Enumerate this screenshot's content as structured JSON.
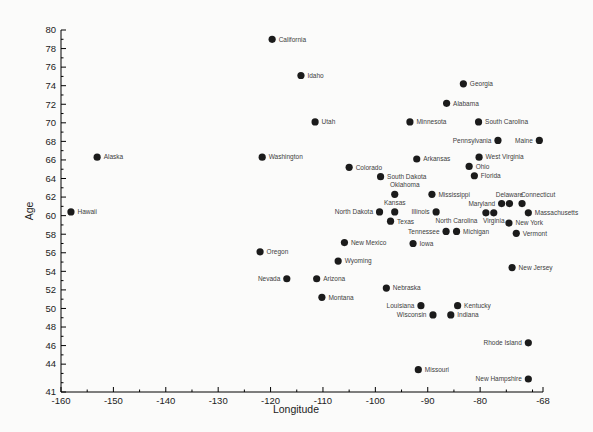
{
  "figure": {
    "background": "#fbfbfa",
    "axis_color": "#000000",
    "tick_label_color": "#222222",
    "point_label_color": "#3d3d3d"
  },
  "chart_data": {
    "type": "scatter",
    "title": "",
    "xlabel": "Longitude",
    "ylabel": "Age",
    "x_range": [
      -160,
      -68
    ],
    "y_range": [
      41,
      80
    ],
    "grid": false,
    "legend": "none",
    "point_color": "#1b1b1b",
    "point_radius": 3.6,
    "x_major_ticks": [
      -160,
      -150,
      -140,
      -130,
      -120,
      -110,
      -100,
      -90,
      -80,
      -68
    ],
    "x_major_tick_labels": [
      "-160",
      "-150",
      "-140",
      "-130",
      "-120",
      "-110",
      "-100",
      "-90",
      "-80",
      "-68"
    ],
    "x_minor_ticks": [
      -155,
      -145,
      -135,
      -125,
      -115,
      -105,
      -95,
      -85,
      -75,
      -70
    ],
    "y_major_ticks": [
      80,
      78,
      76,
      74,
      72,
      70,
      68,
      66,
      64,
      62,
      60,
      58,
      56,
      54,
      52,
      50,
      48,
      46,
      44,
      41
    ],
    "y_major_tick_labels": [
      "80",
      "78",
      "76",
      "74",
      "72",
      "70",
      "68",
      "66",
      "64",
      "62",
      "60",
      "58",
      "56",
      "54",
      "52",
      "50",
      "48",
      "46",
      "44",
      "41"
    ],
    "y_minor_ticks": [
      79,
      77,
      75,
      73,
      71,
      69,
      67,
      65,
      63,
      61,
      59,
      57,
      55,
      53,
      51,
      49,
      47,
      45,
      43,
      42
    ],
    "points": [
      {
        "label": "Hawaii",
        "x": -158.1,
        "y": 60.4,
        "side": "right"
      },
      {
        "label": "Alaska",
        "x": -153.1,
        "y": 66.3,
        "side": "right"
      },
      {
        "label": "Oregon",
        "x": -122.0,
        "y": 56.1,
        "side": "right"
      },
      {
        "label": "Washington",
        "x": -121.6,
        "y": 66.3,
        "side": "right"
      },
      {
        "label": "California",
        "x": -119.7,
        "y": 79.0,
        "side": "right"
      },
      {
        "label": "Nevada",
        "x": -116.9,
        "y": 53.2,
        "side": "left"
      },
      {
        "label": "Idaho",
        "x": -114.2,
        "y": 75.1,
        "side": "right"
      },
      {
        "label": "Utah",
        "x": -111.5,
        "y": 70.1,
        "side": "right"
      },
      {
        "label": "Arizona",
        "x": -111.2,
        "y": 53.2,
        "side": "right"
      },
      {
        "label": "Montana",
        "x": -110.2,
        "y": 51.2,
        "side": "right"
      },
      {
        "label": "Wyoming",
        "x": -107.1,
        "y": 55.1,
        "side": "right"
      },
      {
        "label": "New Mexico",
        "x": -105.9,
        "y": 57.1,
        "side": "right"
      },
      {
        "label": "Colorado",
        "x": -105.0,
        "y": 65.2,
        "side": "right"
      },
      {
        "label": "North Dakota",
        "x": -99.2,
        "y": 60.4,
        "side": "left"
      },
      {
        "label": "South Dakota",
        "x": -99.0,
        "y": 64.2,
        "side": "right"
      },
      {
        "label": "Nebraska",
        "x": -97.9,
        "y": 52.2,
        "side": "right"
      },
      {
        "label": "Texas",
        "x": -97.1,
        "y": 59.4,
        "side": "right"
      },
      {
        "label": "Oklahoma",
        "x": -96.3,
        "y": 62.3,
        "side": "above",
        "dx": 10
      },
      {
        "label": "Kansas",
        "x": -96.3,
        "y": 60.4,
        "side": "above"
      },
      {
        "label": "Minnesota",
        "x": -93.4,
        "y": 70.1,
        "side": "right"
      },
      {
        "label": "Iowa",
        "x": -92.8,
        "y": 57.0,
        "side": "right"
      },
      {
        "label": "Arkansas",
        "x": -92.1,
        "y": 66.1,
        "side": "right"
      },
      {
        "label": "Missouri",
        "x": -91.8,
        "y": 43.4,
        "side": "right"
      },
      {
        "label": "Louisiana",
        "x": -91.3,
        "y": 50.3,
        "side": "left"
      },
      {
        "label": "Mississippi",
        "x": -89.2,
        "y": 62.3,
        "side": "right"
      },
      {
        "label": "Wisconsin",
        "x": -89.0,
        "y": 49.3,
        "side": "left"
      },
      {
        "label": "Illinois",
        "x": -88.4,
        "y": 60.4,
        "side": "left"
      },
      {
        "label": "Tennessee",
        "x": -86.5,
        "y": 58.3,
        "side": "left"
      },
      {
        "label": "Alabama",
        "x": -86.4,
        "y": 72.1,
        "side": "right"
      },
      {
        "label": "Indiana",
        "x": -85.6,
        "y": 49.3,
        "side": "right"
      },
      {
        "label": "Michigan",
        "x": -84.5,
        "y": 58.3,
        "side": "right"
      },
      {
        "label": "Kentucky",
        "x": -84.3,
        "y": 50.3,
        "side": "right"
      },
      {
        "label": "Georgia",
        "x": -83.2,
        "y": 74.2,
        "side": "right"
      },
      {
        "label": "Ohio",
        "x": -82.1,
        "y": 65.3,
        "side": "right"
      },
      {
        "label": "Florida",
        "x": -81.1,
        "y": 64.3,
        "side": "right"
      },
      {
        "label": "South Carolina",
        "x": -80.3,
        "y": 70.1,
        "side": "right"
      },
      {
        "label": "West Virginia",
        "x": -80.2,
        "y": 66.3,
        "side": "right"
      },
      {
        "label": "North Carolina",
        "x": -78.9,
        "y": 60.3,
        "side": "left",
        "dx": -2,
        "dy": 10
      },
      {
        "label": "Virginia",
        "x": -77.4,
        "y": 60.3,
        "side": "below"
      },
      {
        "label": "Pennsylvania",
        "x": -76.6,
        "y": 68.1,
        "side": "left"
      },
      {
        "label": "Maryland",
        "x": -75.9,
        "y": 61.3,
        "side": "left"
      },
      {
        "label": "Delaware",
        "x": -74.4,
        "y": 61.3,
        "side": "above"
      },
      {
        "label": "New York",
        "x": -74.5,
        "y": 59.2,
        "side": "right"
      },
      {
        "label": "New Jersey",
        "x": -73.9,
        "y": 54.4,
        "side": "right"
      },
      {
        "label": "Vermont",
        "x": -73.1,
        "y": 58.1,
        "side": "right"
      },
      {
        "label": "Connecticut",
        "x": -72.0,
        "y": 61.3,
        "side": "above",
        "dx": 16
      },
      {
        "label": "Massachusetts",
        "x": -70.8,
        "y": 60.3,
        "side": "right"
      },
      {
        "label": "Rhode Island",
        "x": -70.8,
        "y": 46.3,
        "side": "left"
      },
      {
        "label": "New Hampshire",
        "x": -70.8,
        "y": 42.4,
        "side": "left"
      },
      {
        "label": "Maine",
        "x": -68.7,
        "y": 68.1,
        "side": "left"
      }
    ]
  }
}
